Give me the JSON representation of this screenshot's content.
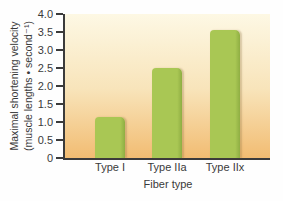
{
  "chart_data": {
    "type": "bar",
    "title": "",
    "categories": [
      "Type I",
      "Type IIa",
      "Type IIx"
    ],
    "values": [
      1.15,
      2.5,
      3.55
    ],
    "xlabel": "Fiber type",
    "ylabel_line1": "Maximal shortening velocity",
    "ylabel_line2": "(muscle lengths • second⁻¹)",
    "ylim": [
      0,
      4.0
    ],
    "ytick_step": 0.5,
    "yticks": [
      "4.0",
      "3.5",
      "3.0",
      "2.5",
      "2.0",
      "1.5",
      "1.0",
      "0.5",
      "0"
    ],
    "grid": false,
    "legend": "none",
    "colors": {
      "bar": "#a9c754",
      "bar_edge": "#8fae43",
      "bg_top": "#fdf8e4",
      "bg_mid": "#f8e4ba",
      "bg_bottom": "#f2bc72",
      "axis": "#3b3b3b",
      "text": "#3a3a3a"
    }
  }
}
